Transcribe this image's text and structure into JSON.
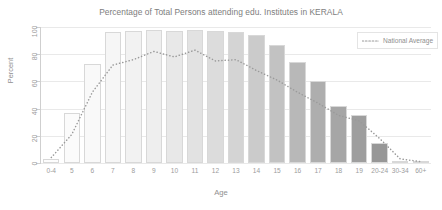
{
  "chart_data": {
    "type": "bar",
    "title": "Percentage of Total Persons attending edu. Institutes in KERALA",
    "xlabel": "Age",
    "ylabel": "Percent",
    "ylim": [
      0,
      100
    ],
    "yticks": [
      0,
      20,
      40,
      60,
      80,
      100
    ],
    "grid": true,
    "legend_position": "top-right",
    "categories": [
      "0-4",
      "5",
      "6",
      "7",
      "8",
      "9",
      "10",
      "11",
      "12",
      "13",
      "14",
      "15",
      "16",
      "17",
      "18",
      "19",
      "20-24",
      "30-34",
      "60+"
    ],
    "series": [
      {
        "name": "Kerala",
        "type": "bar",
        "values": [
          3,
          37,
          73,
          96,
          97,
          98,
          97,
          98,
          97,
          96,
          94,
          87,
          74,
          60,
          42,
          35,
          15,
          1.5,
          1.5
        ],
        "bar_colors": [
          "#fdfdfd",
          "#fbfbfb",
          "#f9f9f9",
          "#f6f6f6",
          "#f2f2f2",
          "#eeeeee",
          "#e8e8e8",
          "#e2e2e2",
          "#dcdcdc",
          "#d4d4d4",
          "#cbcbcb",
          "#c2c2c2",
          "#b8b8b8",
          "#aeaeae",
          "#a6a6a6",
          "#9e9e9e",
          "#979797",
          "#919191",
          "#8c8c8c"
        ]
      },
      {
        "name": "National Average",
        "type": "line",
        "style": "dotted",
        "color": "#9a9a9a",
        "values": [
          4,
          21,
          52,
          72,
          76,
          82,
          78,
          83,
          75,
          76,
          68,
          61,
          52,
          44,
          35,
          31,
          18,
          3,
          1
        ]
      }
    ],
    "legend": [
      {
        "label": "National Average",
        "marker": "dotted-line",
        "color": "#9a9a9a"
      }
    ],
    "colors": {
      "grid": "#e9e9e9",
      "axis": "#cfcfcf",
      "text": "#8f8f8f",
      "title": "#7d7d7d",
      "bar_edge": "#d8d8d8"
    }
  }
}
